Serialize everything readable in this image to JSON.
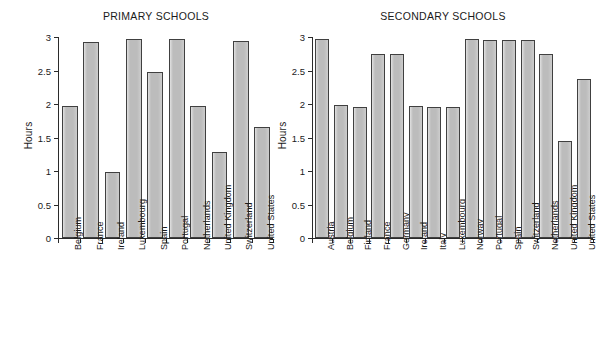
{
  "figure": {
    "ylabel": "Hours"
  },
  "chart_data": [
    {
      "type": "bar",
      "title": "PRIMARY SCHOOLS",
      "xlabel": "",
      "ylabel": "Hours",
      "ylim": [
        0,
        3
      ],
      "yticks": [
        0,
        0.5,
        1,
        1.5,
        2,
        2.5,
        3
      ],
      "ytick_labels": [
        "0",
        "0.5",
        "1",
        "1.5",
        "2",
        "2.5",
        "3"
      ],
      "grid": false,
      "legend": "none",
      "categories": [
        "Belgium",
        "France",
        "Ireland",
        "Luxembourg",
        "Spain",
        "Portugal",
        "Netherlands",
        "United Kingdom",
        "Switzerland",
        "United States"
      ],
      "values": [
        1.97,
        2.93,
        0.99,
        2.97,
        2.48,
        2.97,
        1.97,
        1.29,
        2.94,
        1.65
      ]
    },
    {
      "type": "bar",
      "title": "SECONDARY SCHOOLS",
      "xlabel": "",
      "ylabel": "Hours",
      "ylim": [
        0,
        3
      ],
      "yticks": [
        0,
        0.5,
        1,
        1.5,
        2,
        2.5,
        3
      ],
      "ytick_labels": [
        "0",
        "0.5",
        "1",
        "1.5",
        "2",
        "2.5",
        "3"
      ],
      "grid": false,
      "legend": "none",
      "categories": [
        "Austria",
        "Belgium",
        "Finland",
        "France",
        "Germany",
        "Ireland",
        "Italy",
        "Luxembourg",
        "Norway",
        "Portugal",
        "Spain",
        "Switzerland",
        "Netherlands",
        "United Kingdom",
        "United States"
      ],
      "values": [
        2.97,
        1.99,
        1.96,
        2.75,
        2.75,
        1.97,
        1.96,
        1.96,
        2.97,
        2.96,
        2.96,
        2.96,
        2.75,
        1.45,
        2.38
      ]
    }
  ]
}
